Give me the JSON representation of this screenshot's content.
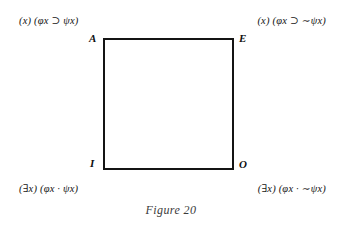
{
  "figure": {
    "caption": "Figure 20",
    "diagram_type": "square-of-opposition",
    "border_color": "#141414",
    "background_color": "#ffffff"
  },
  "vertices": [
    {
      "key": "A",
      "label": "A",
      "position": "top-left"
    },
    {
      "key": "E",
      "label": "E",
      "position": "top-right"
    },
    {
      "key": "I",
      "label": "I",
      "position": "bottom-left"
    },
    {
      "key": "O",
      "label": "O",
      "position": "bottom-right"
    }
  ],
  "formulas": {
    "top_left": "(x) (φx ⊃ ψx)",
    "top_right": "(x) (φx ⊃ ∼ψx)",
    "bottom_left": "(∃x) (φx · ψx)",
    "bottom_right": "(∃x) (φx · ∼ψx)"
  }
}
